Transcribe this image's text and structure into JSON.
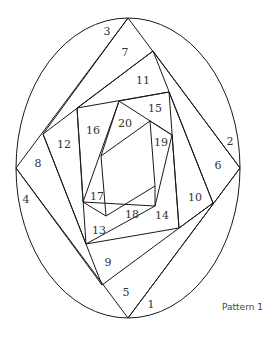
{
  "caption": "Pattern 1",
  "diagram": {
    "type": "iris-folding-pattern",
    "shape": "oval",
    "segments": [
      {
        "label": "1",
        "x": 151,
        "y": 305
      },
      {
        "label": "2",
        "x": 230,
        "y": 142
      },
      {
        "label": "3",
        "x": 107,
        "y": 32
      },
      {
        "label": "4",
        "x": 26,
        "y": 200
      },
      {
        "label": "5",
        "x": 126,
        "y": 293
      },
      {
        "label": "6",
        "x": 218,
        "y": 166
      },
      {
        "label": "7",
        "x": 125,
        "y": 53
      },
      {
        "label": "8",
        "x": 38,
        "y": 164
      },
      {
        "label": "9",
        "x": 108,
        "y": 263
      },
      {
        "label": "10",
        "x": 195,
        "y": 198
      },
      {
        "label": "11",
        "x": 143,
        "y": 81
      },
      {
        "label": "12",
        "x": 64,
        "y": 145
      },
      {
        "label": "13",
        "x": 99,
        "y": 231
      },
      {
        "label": "14",
        "x": 162,
        "y": 216
      },
      {
        "label": "15",
        "x": 155,
        "y": 109
      },
      {
        "label": "16",
        "x": 93,
        "y": 131
      },
      {
        "label": "17",
        "x": 97,
        "y": 197
      },
      {
        "label": "18",
        "x": 132,
        "y": 215
      },
      {
        "label": "19",
        "x": 161,
        "y": 143
      },
      {
        "label": "20",
        "x": 125,
        "y": 124
      }
    ]
  }
}
